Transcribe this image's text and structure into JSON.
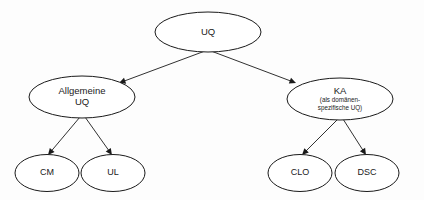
{
  "diagram": {
    "type": "hierarchy-tree",
    "colors": {
      "background": "#fdfdfd",
      "node_fill": "#ffffff",
      "stroke": "#1a1a1a",
      "text": "#1a1a1a"
    },
    "nodes": [
      {
        "id": "uq",
        "label": "UQ",
        "sublabels": [],
        "level": 0,
        "cx": 208,
        "cy": 32,
        "rx": 53,
        "ry": 20
      },
      {
        "id": "allgemeine-uq",
        "label": "Allgemeine",
        "sublabels": [
          "UQ"
        ],
        "level": 1,
        "cx": 82,
        "cy": 97,
        "rx": 53,
        "ry": 21
      },
      {
        "id": "ka",
        "label": "KA",
        "sublabels": [
          "(als domänen-",
          "spezifische UQ)"
        ],
        "level": 1,
        "cx": 340,
        "cy": 99,
        "rx": 53,
        "ry": 21
      },
      {
        "id": "cm",
        "label": "CM",
        "sublabels": [],
        "level": 2,
        "cx": 47,
        "cy": 173,
        "rx": 32,
        "ry": 18.5
      },
      {
        "id": "ul",
        "label": "UL",
        "sublabels": [],
        "level": 2,
        "cx": 113,
        "cy": 173,
        "rx": 32,
        "ry": 18.5
      },
      {
        "id": "clo",
        "label": "CLO",
        "sublabels": [],
        "level": 2,
        "cx": 300,
        "cy": 173,
        "rx": 32,
        "ry": 18.5
      },
      {
        "id": "dsc",
        "label": "DSC",
        "sublabels": [],
        "level": 2,
        "cx": 367,
        "cy": 173,
        "rx": 32,
        "ry": 18.5
      }
    ],
    "edges": [
      {
        "id": "uq-allgemeine",
        "from": "uq",
        "to": "allgemeine-uq",
        "x1": 205,
        "y1": 51,
        "x2": 119,
        "y2": 83,
        "arrow": true
      },
      {
        "id": "uq-ka",
        "from": "uq",
        "to": "ka",
        "x1": 211,
        "y1": 51,
        "x2": 296,
        "y2": 83,
        "arrow": true
      },
      {
        "id": "allgemeine-cm",
        "from": "allgemeine-uq",
        "to": "cm",
        "x1": 80,
        "y1": 117,
        "x2": 48,
        "y2": 155,
        "arrow": true
      },
      {
        "id": "allgemeine-ul",
        "from": "allgemeine-uq",
        "to": "ul",
        "x1": 85,
        "y1": 117,
        "x2": 112,
        "y2": 155,
        "arrow": true
      },
      {
        "id": "ka-clo",
        "from": "ka",
        "to": "clo",
        "x1": 338,
        "y1": 119,
        "x2": 302,
        "y2": 155,
        "arrow": true
      },
      {
        "id": "ka-dsc",
        "from": "ka",
        "to": "dsc",
        "x1": 343,
        "y1": 119,
        "x2": 366,
        "y2": 155,
        "arrow": true
      }
    ]
  }
}
